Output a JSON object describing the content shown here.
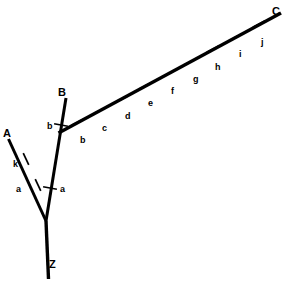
{
  "diagram": {
    "background_color": "#ffffff",
    "line_color": "#000000",
    "width": 291,
    "height": 302,
    "terminals": [
      {
        "id": "A",
        "label": "A",
        "label_x": 3,
        "label_y": 137
      },
      {
        "id": "B",
        "label": "B",
        "label_x": 58,
        "label_y": 96
      },
      {
        "id": "C",
        "label": "C",
        "label_x": 272,
        "label_y": 15
      },
      {
        "id": "Z",
        "label": "Z",
        "label_x": 49,
        "label_y": 268
      }
    ],
    "branches": [
      {
        "name": "trunk-z",
        "from": "root",
        "to": "Z",
        "x1": 46,
        "y1": 221,
        "x2": 48.5,
        "y2": 279,
        "width": 3.4
      },
      {
        "name": "branch-a",
        "from": "root",
        "to": "A",
        "x1": 46,
        "y1": 221,
        "x2": 8.5,
        "y2": 139,
        "width": 3.0
      },
      {
        "name": "branch-b",
        "from": "root",
        "to": "B",
        "x1": 46,
        "y1": 221,
        "x2": 66,
        "y2": 98,
        "width": 3.0
      },
      {
        "name": "branch-c",
        "from": "branch-b",
        "to": "C",
        "x1": 58.5,
        "y1": 133,
        "x2": 281,
        "y2": 13,
        "width": 3.4
      }
    ],
    "ticks": [
      {
        "branch": "branch-a",
        "label": "k",
        "x": 26,
        "y": 159,
        "angle": 65,
        "len": 13,
        "label_x": 13,
        "label_y": 167
      },
      {
        "branch": "branch-a",
        "label": "a",
        "x": 38,
        "y": 185,
        "angle": 65,
        "len": 13,
        "label_x": 16,
        "label_y": 192
      },
      {
        "branch": "branch-b",
        "label": "a",
        "x": 50,
        "y": 188,
        "angle": 10,
        "len": 14,
        "label_x": 60,
        "label_y": 192
      },
      {
        "branch": "branch-b",
        "label": "b",
        "x": 61,
        "y": 125,
        "angle": 10,
        "len": 14,
        "label_x": 47,
        "label_y": 129
      },
      {
        "branch": "branch-c",
        "label": "b",
        "x": 78,
        "y": 122,
        "angle": -28,
        "len": 14,
        "label_x": 80,
        "label_y": 143
      },
      {
        "branch": "branch-c",
        "label": "c",
        "x": 99,
        "y": 111,
        "angle": -28,
        "len": 14,
        "label_x": 102,
        "label_y": 131
      },
      {
        "branch": "branch-c",
        "label": "d",
        "x": 122,
        "y": 99,
        "angle": -28,
        "len": 14,
        "label_x": 125,
        "label_y": 119
      },
      {
        "branch": "branch-c",
        "label": "e",
        "x": 145,
        "y": 86,
        "angle": -28,
        "len": 14,
        "label_x": 148,
        "label_y": 106
      },
      {
        "branch": "branch-c",
        "label": "f",
        "x": 168,
        "y": 74,
        "angle": -28,
        "len": 14,
        "label_x": 171,
        "label_y": 94
      },
      {
        "branch": "branch-c",
        "label": "g",
        "x": 190,
        "y": 62,
        "angle": -28,
        "len": 14,
        "label_x": 193,
        "label_y": 82
      },
      {
        "branch": "branch-c",
        "label": "h",
        "x": 213,
        "y": 49,
        "angle": -28,
        "len": 14,
        "label_x": 215,
        "label_y": 70
      },
      {
        "branch": "branch-c",
        "label": "i",
        "x": 236,
        "y": 37,
        "angle": -28,
        "len": 14,
        "label_x": 239,
        "label_y": 57
      },
      {
        "branch": "branch-c",
        "label": "j",
        "x": 259,
        "y": 24,
        "angle": -28,
        "len": 14,
        "label_x": 261,
        "label_y": 45
      }
    ]
  }
}
